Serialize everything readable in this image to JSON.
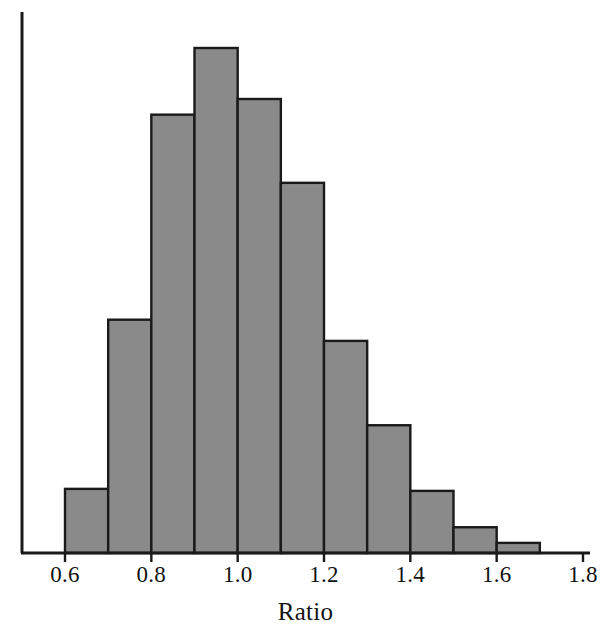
{
  "chart_data": {
    "type": "bar",
    "title": "",
    "subtitle": "",
    "xlabel": "Ratio",
    "ylabel": "",
    "xlim": [
      0.5,
      1.8
    ],
    "ylim": [
      0,
      1.0
    ],
    "grid": false,
    "legend": null,
    "bin_width": 0.1,
    "bar_fill_color": "#8a8a8a",
    "bar_edge_color": "#1a1a1a",
    "axis_color": "#1a1a1a",
    "background_color": "#ffffff",
    "x_ticks": [
      {
        "value": 0.6,
        "label": "0.6"
      },
      {
        "value": 0.8,
        "label": "0.8"
      },
      {
        "value": 1.0,
        "label": "1.0"
      },
      {
        "value": 1.2,
        "label": "1.2"
      },
      {
        "value": 1.4,
        "label": "1.4"
      },
      {
        "value": 1.6,
        "label": "1.6"
      },
      {
        "value": 1.8,
        "label": "1.8"
      }
    ],
    "y_ticks": [],
    "categories": [
      "0.6-0.7",
      "0.7-0.8",
      "0.8-0.9",
      "0.9-1.0",
      "1.0-1.1",
      "1.1-1.2",
      "1.2-1.3",
      "1.3-1.4",
      "1.4-1.5",
      "1.5-1.6",
      "1.6-1.7"
    ],
    "bin_edges": [
      0.6,
      0.7,
      0.8,
      0.9,
      1.0,
      1.1,
      1.2,
      1.3,
      1.4,
      1.5,
      1.6,
      1.7
    ],
    "values": [
      0.127,
      0.462,
      0.868,
      1.0,
      0.899,
      0.733,
      0.42,
      0.253,
      0.123,
      0.051,
      0.02
    ],
    "bars": [
      {
        "x0": 0.6,
        "x1": 0.7,
        "height": 0.127
      },
      {
        "x0": 0.7,
        "x1": 0.8,
        "height": 0.462
      },
      {
        "x0": 0.8,
        "x1": 0.9,
        "height": 0.868
      },
      {
        "x0": 0.9,
        "x1": 1.0,
        "height": 1.0
      },
      {
        "x0": 1.0,
        "x1": 1.1,
        "height": 0.899
      },
      {
        "x0": 1.1,
        "x1": 1.2,
        "height": 0.733
      },
      {
        "x0": 1.2,
        "x1": 1.3,
        "height": 0.42
      },
      {
        "x0": 1.3,
        "x1": 1.4,
        "height": 0.253
      },
      {
        "x0": 1.4,
        "x1": 1.5,
        "height": 0.123
      },
      {
        "x0": 1.5,
        "x1": 1.6,
        "height": 0.051
      },
      {
        "x0": 1.6,
        "x1": 1.7,
        "height": 0.02
      }
    ]
  },
  "axis_title": {
    "x": "Ratio"
  }
}
